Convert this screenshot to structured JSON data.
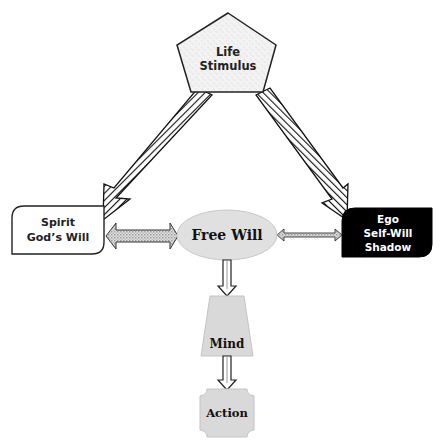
{
  "diagram": {
    "nodes": {
      "life_stimulus": {
        "line1": "Life",
        "line2": "Stimulus",
        "shape": "pentagon",
        "fill": "#f0f0f0"
      },
      "spirit": {
        "line1": "Spirit",
        "line2": "God’s Will",
        "shape": "rounded-rect",
        "fill": "#ffffff"
      },
      "ego": {
        "line1": "Ego",
        "line2": "Self-Will",
        "line3": "Shadow",
        "shape": "rounded-rect",
        "fill": "#000000",
        "text_color": "#ffffff"
      },
      "free_will": {
        "label": "Free Will",
        "shape": "ellipse",
        "fill": "#e0e0e0"
      },
      "mind": {
        "label": "Mind",
        "shape": "trapezoid",
        "fill": "#d9d9d9"
      },
      "action": {
        "label": "Action",
        "shape": "notched-rect",
        "fill": "#d9d9d9"
      }
    },
    "edges": [
      {
        "from": "life_stimulus",
        "to": "spirit",
        "style": "hatched-arrow"
      },
      {
        "from": "life_stimulus",
        "to": "ego",
        "style": "hatched-arrow"
      },
      {
        "from": "spirit",
        "to": "free_will",
        "style": "double-arrow-thick",
        "bidirectional": true
      },
      {
        "from": "free_will",
        "to": "ego",
        "style": "double-arrow-thin",
        "bidirectional": true
      },
      {
        "from": "free_will",
        "to": "mind",
        "style": "hollow-arrow"
      },
      {
        "from": "mind",
        "to": "action",
        "style": "hollow-arrow"
      }
    ]
  }
}
